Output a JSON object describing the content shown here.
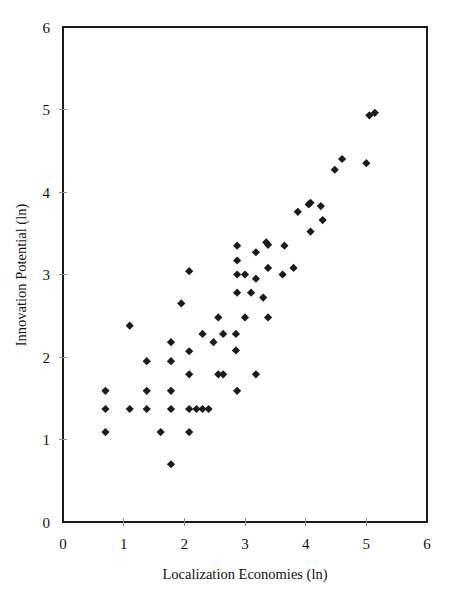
{
  "chart_data": {
    "type": "scatter",
    "title": "",
    "xlabel": "Localization Economies (ln)",
    "ylabel": "Innovation Potential (ln)",
    "xlim": [
      0,
      6
    ],
    "ylim": [
      0,
      6
    ],
    "xticks": [
      "0",
      "1",
      "2",
      "3",
      "4",
      "5",
      "6"
    ],
    "yticks": [
      "0",
      "1",
      "2",
      "3",
      "4",
      "5",
      "6"
    ],
    "xtick_values": [
      0,
      1,
      2,
      3,
      4,
      5,
      6
    ],
    "ytick_values": [
      0,
      1,
      2,
      3,
      4,
      5,
      6
    ],
    "grid": false,
    "legend": null,
    "marker_shape": "diamond",
    "marker_color": "#1b1b1b",
    "marker_size_px": 7,
    "series": [
      {
        "name": "observations",
        "points": [
          [
            0.7,
            1.59
          ],
          [
            0.7,
            1.37
          ],
          [
            0.7,
            1.09
          ],
          [
            1.1,
            2.38
          ],
          [
            1.1,
            1.37
          ],
          [
            1.38,
            1.95
          ],
          [
            1.38,
            1.59
          ],
          [
            1.38,
            1.37
          ],
          [
            1.61,
            1.09
          ],
          [
            1.78,
            2.18
          ],
          [
            1.78,
            1.95
          ],
          [
            1.78,
            1.59
          ],
          [
            1.78,
            1.37
          ],
          [
            1.78,
            0.7
          ],
          [
            1.95,
            2.65
          ],
          [
            2.08,
            3.04
          ],
          [
            2.08,
            2.07
          ],
          [
            2.08,
            1.79
          ],
          [
            2.08,
            1.37
          ],
          [
            2.08,
            1.09
          ],
          [
            2.2,
            1.37
          ],
          [
            2.3,
            1.37
          ],
          [
            2.4,
            1.37
          ],
          [
            2.3,
            2.28
          ],
          [
            2.48,
            2.18
          ],
          [
            2.56,
            1.79
          ],
          [
            2.64,
            1.79
          ],
          [
            2.56,
            2.48
          ],
          [
            2.64,
            2.28
          ],
          [
            2.85,
            2.28
          ],
          [
            2.85,
            2.08
          ],
          [
            2.87,
            1.59
          ],
          [
            2.87,
            2.78
          ],
          [
            2.87,
            3.0
          ],
          [
            2.87,
            3.17
          ],
          [
            2.87,
            3.35
          ],
          [
            3.0,
            3.0
          ],
          [
            3.0,
            2.48
          ],
          [
            3.1,
            2.78
          ],
          [
            3.18,
            3.27
          ],
          [
            3.18,
            2.95
          ],
          [
            3.18,
            1.79
          ],
          [
            3.3,
            2.72
          ],
          [
            3.35,
            3.39
          ],
          [
            3.38,
            3.36
          ],
          [
            3.38,
            3.08
          ],
          [
            3.38,
            2.48
          ],
          [
            3.62,
            3.0
          ],
          [
            3.65,
            3.35
          ],
          [
            3.8,
            3.08
          ],
          [
            3.87,
            3.76
          ],
          [
            4.05,
            3.85
          ],
          [
            4.08,
            3.87
          ],
          [
            4.08,
            3.52
          ],
          [
            4.25,
            3.83
          ],
          [
            4.28,
            3.66
          ],
          [
            4.48,
            4.27
          ],
          [
            4.6,
            4.4
          ],
          [
            5.0,
            4.35
          ],
          [
            5.05,
            4.93
          ],
          [
            5.14,
            4.96
          ]
        ]
      }
    ]
  },
  "axes": {
    "x_title": "Localization Economies (ln)",
    "y_title": "Innovation Potential (ln)"
  }
}
